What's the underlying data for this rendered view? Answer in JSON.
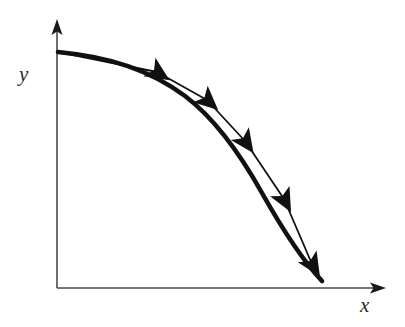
{
  "figure": {
    "background_color": "#ffffff",
    "width": 405,
    "height": 327
  },
  "axes": {
    "color": "#4a4a4a",
    "stroke_width": 1.6,
    "origin": {
      "x": 57,
      "y": 288
    },
    "x_axis": {
      "label": "x",
      "label_position": {
        "x": 360,
        "y": 295
      },
      "start": {
        "x": 57,
        "y": 288
      },
      "end": {
        "x": 385,
        "y": 288
      },
      "arrowhead": "solid-triangle-right"
    },
    "y_axis": {
      "label": "y",
      "label_position": {
        "x": 19,
        "y": 64
      },
      "start": {
        "x": 57,
        "y": 288
      },
      "end": {
        "x": 57,
        "y": 22
      },
      "arrowhead": "solid-triangle-up"
    }
  },
  "curve": {
    "color": "#111111",
    "stroke_width": 4.6,
    "style": "solid",
    "direction": "down-right",
    "path": "M58,52 C110,57 150,70 185,96 C214,118 238,150 262,193 C284,232 304,262 322,281",
    "start_point": {
      "x": 58,
      "y": 52
    },
    "end_point": {
      "x": 322,
      "y": 281
    }
  },
  "chart_data": {
    "type": "line",
    "title": "",
    "xlabel": "x",
    "ylabel": "y",
    "grid": false,
    "legend": null,
    "axis_arrows": true,
    "tick_labels": {
      "x": [],
      "y": []
    },
    "xlim": [
      0,
      1
    ],
    "ylim": [
      0,
      1
    ],
    "series": [
      {
        "name": "curve",
        "comment": "Normalized 0-1 coordinates read off the plotted curve; y measured upward from the x-axis.",
        "x": [
          0.0,
          0.09,
          0.19,
          0.29,
          0.39,
          0.5,
          0.6,
          0.7,
          0.78,
          0.87,
          0.94,
          1.0
        ],
        "y": [
          1.0,
          0.98,
          0.95,
          0.9,
          0.83,
          0.73,
          0.61,
          0.47,
          0.35,
          0.23,
          0.13,
          0.05
        ]
      }
    ],
    "annotations": [
      {
        "type": "arrowhead",
        "label": "direction-arrow-1",
        "x": 0.33,
        "y": 0.88,
        "angle_deg": 33
      },
      {
        "type": "arrowhead",
        "label": "direction-arrow-2",
        "x": 0.48,
        "y": 0.76,
        "angle_deg": 42
      },
      {
        "type": "arrowhead",
        "label": "direction-arrow-3",
        "x": 0.63,
        "y": 0.58,
        "angle_deg": 55
      },
      {
        "type": "arrowhead",
        "label": "direction-arrow-4",
        "x": 0.79,
        "y": 0.33,
        "angle_deg": 62
      },
      {
        "type": "arrowhead",
        "label": "direction-arrow-5",
        "x": 0.92,
        "y": 0.12,
        "angle_deg": 58
      }
    ]
  },
  "arrows": {
    "color": "#111111",
    "shape": "barbed-swallowtail",
    "markers": [
      {
        "name": "direction-arrow-1",
        "x": 157,
        "y": 72,
        "angle_deg": 33,
        "size": 15
      },
      {
        "name": "direction-arrow-2",
        "x": 207,
        "y": 100,
        "angle_deg": 42,
        "size": 15
      },
      {
        "name": "direction-arrow-3",
        "x": 245,
        "y": 141,
        "angle_deg": 55,
        "size": 15
      },
      {
        "name": "direction-arrow-4",
        "x": 284,
        "y": 199,
        "angle_deg": 62,
        "size": 15
      },
      {
        "name": "direction-arrow-5",
        "x": 312,
        "y": 264,
        "angle_deg": 58,
        "size": 15
      }
    ]
  }
}
